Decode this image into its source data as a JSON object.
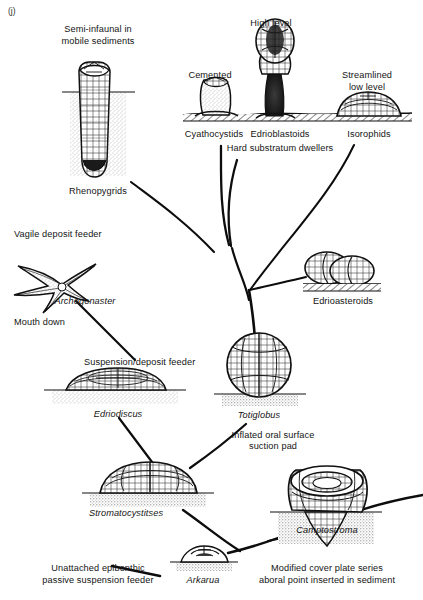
{
  "figure": {
    "panel_tag": "(j)",
    "type": "diagram"
  },
  "taxa": [
    {
      "id": "rhenopygrids",
      "name": "Rhenopygrids",
      "habit": "Semi-infaunal in\nmobile sediments",
      "x": 98,
      "y": 186,
      "habit_x": 98,
      "habit_y": 24
    },
    {
      "id": "cyathocystids",
      "name": "Cyathocystids",
      "habit": "Cemented",
      "x": 214,
      "y": 129,
      "habit_x": 210,
      "habit_y": 70
    },
    {
      "id": "edrioblastoids",
      "name": "Edrioblastoids",
      "habit": "High  level",
      "x": 277,
      "y": 129,
      "habit_x": 271,
      "habit_y": 18
    },
    {
      "id": "isorophids",
      "name": "Isorophids",
      "habit": "Streamlined\nlow level",
      "x": 369,
      "y": 129,
      "habit_x": 367,
      "habit_y": 70
    },
    {
      "id": "edrioasteroids",
      "name": "Edrioasteroids",
      "habit": "",
      "x": 343,
      "y": 299,
      "habit_x": 0,
      "habit_y": 0
    },
    {
      "id": "archegonaster",
      "name": "Archegonaster",
      "habit": "Vagile deposit feeder",
      "x": 85,
      "y": 296,
      "habit_x": 14,
      "habit_y": 229
    },
    {
      "id": "edriodiscus",
      "name": "Edriodiscus",
      "habit": "Suspension/deposit feeder",
      "x": 115,
      "y": 409,
      "habit_x": 84,
      "habit_y": 357
    },
    {
      "id": "totiglobus",
      "name": "Totiglobus",
      "habit": "",
      "x": 259,
      "y": 410,
      "habit_x": 0,
      "habit_y": 0
    },
    {
      "id": "stromatocystitses",
      "name": "Stromatocystitses",
      "habit": "",
      "x": 126,
      "y": 508,
      "habit_x": 0,
      "habit_y": 0
    },
    {
      "id": "arkarua",
      "name": "Arkarua",
      "habit": "",
      "x": 203,
      "y": 575,
      "habit_x": 0,
      "habit_y": 0
    },
    {
      "id": "camptostroma",
      "name": "Camptostroma",
      "habit": "",
      "x": 327,
      "y": 525,
      "habit_x": 0,
      "habit_y": 0
    }
  ],
  "annotations": [
    {
      "id": "hard-substratum-dwellers",
      "text": "Hard substratum dwellers",
      "x": 280,
      "y": 143
    },
    {
      "id": "mouth-down",
      "text": "Mouth down",
      "x": 14,
      "y": 317
    },
    {
      "id": "inflated-oral-surface",
      "text": "Inflated oral  surface",
      "x": 273,
      "y": 430
    },
    {
      "id": "suction-pad",
      "text": "suction pad",
      "x": 273,
      "y": 441
    },
    {
      "id": "unattached-epibenthic",
      "text": "Unattached epibenthic",
      "x": 98,
      "y": 563
    },
    {
      "id": "passive-suspension-feeder",
      "text": "passive suspension feeder",
      "x": 98,
      "y": 575
    },
    {
      "id": "modified-cover-plate-series",
      "text": "Modified cover plate series",
      "x": 327,
      "y": 563
    },
    {
      "id": "aboral-point-inserted",
      "text": "aboral point inserted in sediment",
      "x": 327,
      "y": 575
    }
  ],
  "colors": {
    "ink": "#111111",
    "paper": "#ffffff",
    "sediment_stipple": "#5a5a5a",
    "shade": "#8a8a8a"
  }
}
